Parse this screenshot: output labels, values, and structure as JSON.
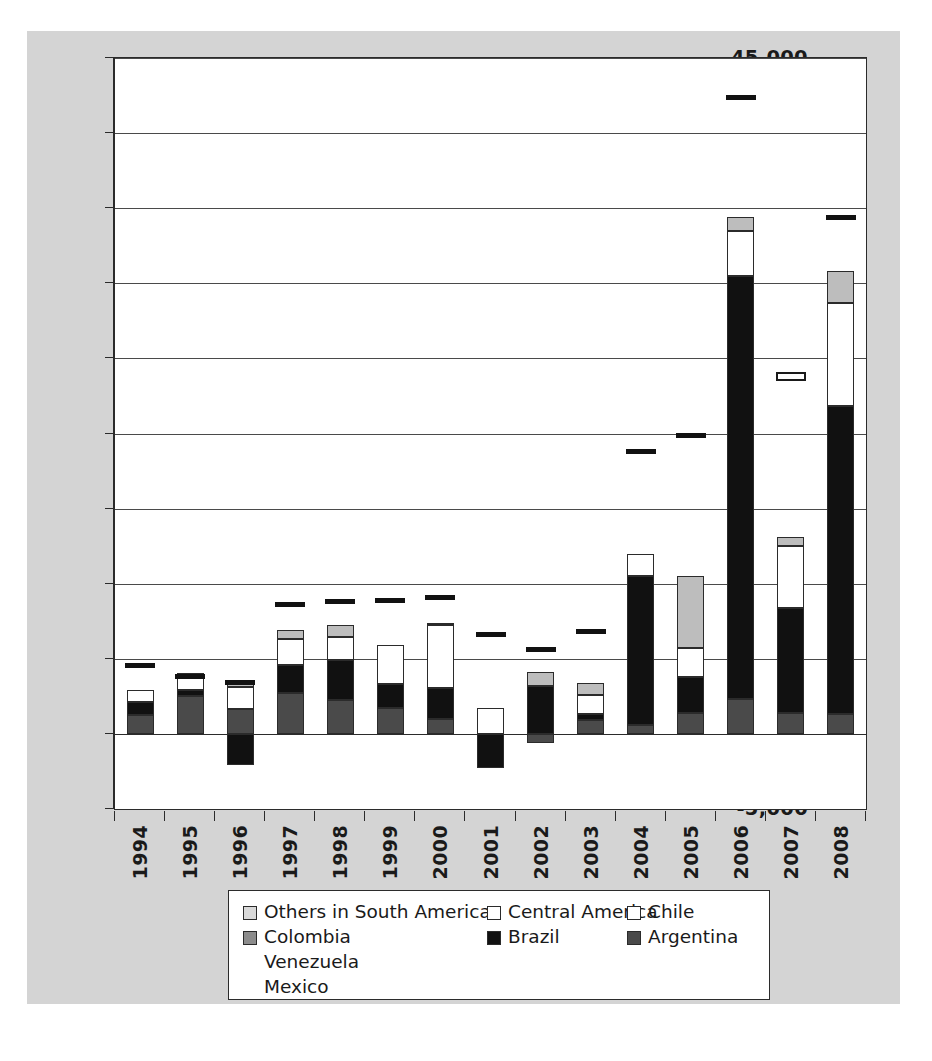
{
  "chart_data": {
    "type": "bar",
    "subtype": "stacked-bar-with-markers",
    "title": "",
    "xlabel": "",
    "ylabel": "",
    "ylim": [
      -5000,
      45000
    ],
    "ytick_interval": 5000,
    "grid": true,
    "legend_position": "bottom",
    "categories": [
      "1994",
      "1995",
      "1996",
      "1997",
      "1998",
      "1999",
      "2000",
      "2001",
      "2002",
      "2003",
      "2004",
      "2005",
      "2006",
      "2007",
      "2008"
    ],
    "ytick_labels": [
      "45,000",
      "40,000",
      "35,000",
      "30,000",
      "25,000",
      "20,000",
      "15,000",
      "10,000",
      "5,000",
      "0",
      "-5,000"
    ],
    "ytick_values": [
      45000,
      40000,
      35000,
      30000,
      25000,
      20000,
      15000,
      10000,
      5000,
      0,
      -5000
    ],
    "series": [
      {
        "name": "Argentina",
        "color": "#4a4a4a",
        "stack_order": 1,
        "values": [
          1250,
          2550,
          1650,
          2700,
          2250,
          1750,
          1000,
          0,
          -600,
          900,
          600,
          1400,
          2300,
          1400,
          1300
        ]
      },
      {
        "name": "Brazil",
        "color": "#111111",
        "stack_order": 2,
        "values": [
          900,
          350,
          -2100,
          1900,
          2700,
          1600,
          2050,
          -2300,
          3200,
          400,
          9900,
          2400,
          28200,
          7000,
          20500
        ]
      },
      {
        "name": "Chile",
        "color": "#ffffff",
        "stack_order": 3,
        "values": [
          800,
          800,
          1450,
          1700,
          1500,
          2550,
          4200,
          1700,
          0,
          1300,
          1500,
          1900,
          3000,
          4100,
          6900
        ]
      },
      {
        "name": "Central America",
        "color": "#ffffff",
        "stack_order": 4,
        "values": [
          0,
          0,
          0,
          0,
          0,
          0,
          0,
          0,
          0,
          0,
          0,
          0,
          0,
          0,
          0
        ]
      },
      {
        "name": "Others in South America",
        "color": "#bdbdbd",
        "stack_order": 5,
        "values": [
          0,
          350,
          350,
          600,
          800,
          0,
          150,
          0,
          900,
          800,
          0,
          4800,
          900,
          600,
          2100
        ]
      },
      {
        "name": "Colombia",
        "color": "#8c8c8c",
        "stack_order": 6,
        "values": [
          0,
          0,
          0,
          0,
          0,
          0,
          0,
          0,
          0,
          0,
          0,
          0,
          0,
          0,
          0
        ]
      }
    ],
    "markers": [
      {
        "name": "Venezuela",
        "style": "hollow",
        "values": [
          null,
          null,
          null,
          null,
          null,
          null,
          null,
          null,
          null,
          null,
          null,
          null,
          null,
          23800,
          null
        ]
      },
      {
        "name": "Mexico",
        "style": "filled",
        "values": [
          4550,
          3850,
          3400,
          8600,
          8800,
          8900,
          9100,
          6650,
          5600,
          6800,
          18800,
          19900,
          42400,
          null,
          34400
        ]
      }
    ],
    "stack_totals": [
      2950,
      4050,
      1350,
      6900,
      7250,
      5900,
      7400,
      -600,
      3500,
      3400,
      12000,
      10500,
      34400,
      13100,
      30800
    ]
  },
  "legend": {
    "columns": [
      {
        "items": [
          {
            "label": "Others in South America",
            "swatch": "#d9d9d9",
            "has_swatch": true
          },
          {
            "label": "Colombia",
            "swatch": "#8c8c8c",
            "has_swatch": true
          },
          {
            "label": "Venezuela",
            "swatch": null,
            "has_swatch": false
          },
          {
            "label": "Mexico",
            "swatch": null,
            "has_swatch": false
          }
        ]
      },
      {
        "items": [
          {
            "label": "Central America",
            "swatch": "#ffffff",
            "has_swatch": true
          },
          {
            "label": "Brazil",
            "swatch": "#111111",
            "has_swatch": true
          }
        ]
      },
      {
        "items": [
          {
            "label": "Chile",
            "swatch": "#ffffff",
            "has_swatch": true
          },
          {
            "label": "Argentina",
            "swatch": "#4a4a4a",
            "has_swatch": true
          }
        ]
      }
    ]
  },
  "colors": {
    "panel_background": "#d4d4d4",
    "plot_background": "#ffffff",
    "axis": "#2b2b2b",
    "gridline": "#4a4a4a",
    "text": "#1a1a1a"
  }
}
